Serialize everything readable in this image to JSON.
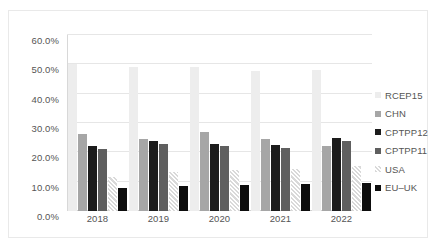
{
  "chart_data": {
    "type": "bar",
    "title": "",
    "xlabel": "",
    "ylabel": "",
    "categories": [
      "2018",
      "2019",
      "2020",
      "2021",
      "2022"
    ],
    "ylim": [
      0,
      60
    ],
    "ytick_labels": [
      "0.0%",
      "10.0%",
      "20.0%",
      "30.0%",
      "40.0%",
      "50.0%",
      "60.0%"
    ],
    "ytick_values": [
      0,
      10,
      20,
      30,
      40,
      50,
      60
    ],
    "grid": true,
    "legend_position": "right",
    "series": [
      {
        "name": "RCEP15",
        "color": "#ededed",
        "values": [
          50.0,
          49.1,
          49.0,
          47.8,
          48.0
        ]
      },
      {
        "name": "CHN",
        "color": "#a6a6a6",
        "values": [
          26.4,
          24.5,
          26.9,
          24.7,
          22.1
        ]
      },
      {
        "name": "CPTPP12",
        "color": "#1c1c1c",
        "values": [
          22.3,
          23.9,
          23.0,
          22.5,
          24.8
        ]
      },
      {
        "name": "CPTPP11",
        "color": "#5f5f5f",
        "values": [
          21.2,
          22.8,
          22.0,
          21.5,
          24.0
        ]
      },
      {
        "name": "USA",
        "color": "#d9d9d9",
        "values": [
          11.5,
          13.2,
          14.1,
          14.3,
          15.5
        ]
      },
      {
        "name": "EU–UK",
        "color": "#0d0d0d",
        "values": [
          8.0,
          8.4,
          8.9,
          9.2,
          9.5
        ]
      }
    ]
  },
  "legend": {
    "items": [
      {
        "label": "RCEP15"
      },
      {
        "label": "CHN"
      },
      {
        "label": "CPTPP12"
      },
      {
        "label": "CPTPP11"
      },
      {
        "label": "USA"
      },
      {
        "label": "EU–UK"
      }
    ]
  }
}
